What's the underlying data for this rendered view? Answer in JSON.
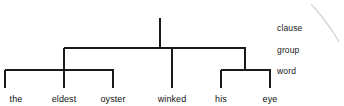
{
  "figure": {
    "type": "constituency-rank-tree",
    "background_color": "#ffffff",
    "line_color": "#1a1a1a",
    "text_color": "#111111",
    "sentence": "the eldest oyster winked his eye"
  },
  "rank_labels": [
    {
      "id": "clause",
      "text": "clause",
      "x": 277,
      "y": 23
    },
    {
      "id": "group",
      "text": "group",
      "x": 277,
      "y": 45
    },
    {
      "id": "word",
      "text": "word",
      "x": 277,
      "y": 66
    }
  ],
  "words": [
    {
      "id": "the",
      "text": "the",
      "x": 16,
      "y": 94
    },
    {
      "id": "eldest",
      "text": "eldest",
      "x": 64,
      "y": 94
    },
    {
      "id": "oyster",
      "text": "oyster",
      "x": 113,
      "y": 94
    },
    {
      "id": "winked",
      "text": "winked",
      "x": 172,
      "y": 94
    },
    {
      "id": "his",
      "text": "his",
      "x": 221,
      "y": 94
    },
    {
      "id": "eye",
      "text": "eye",
      "x": 270,
      "y": 94
    }
  ],
  "tree_geometry": {
    "clause_stem": {
      "x": 160,
      "y1": 18,
      "y2": 48
    },
    "group_bar": {
      "x1": 64,
      "x2": 245,
      "y": 48
    },
    "group_drops": [
      {
        "x": 64,
        "y1": 48,
        "y2": 70
      },
      {
        "x": 172,
        "y1": 48,
        "y2": 88
      },
      {
        "x": 245,
        "y1": 48,
        "y2": 70
      }
    ],
    "word_bars": [
      {
        "id": "nominal-group-bar",
        "x1": 5,
        "x2": 113,
        "y": 70
      },
      {
        "id": "possessive-group-bar",
        "x1": 221,
        "x2": 270,
        "y": 70
      }
    ],
    "word_drops": [
      {
        "x": 5,
        "y1": 70,
        "y2": 88
      },
      {
        "x": 64,
        "y1": 70,
        "y2": 88
      },
      {
        "x": 113,
        "y1": 70,
        "y2": 88
      },
      {
        "x": 221,
        "y1": 70,
        "y2": 88
      },
      {
        "x": 270,
        "y1": 70,
        "y2": 88
      }
    ]
  },
  "artifact": {
    "id": "scan-smudge",
    "description": "faint diagonal scan smudge",
    "x1": 311,
    "y1": 4,
    "x2": 339,
    "y2": 42
  }
}
